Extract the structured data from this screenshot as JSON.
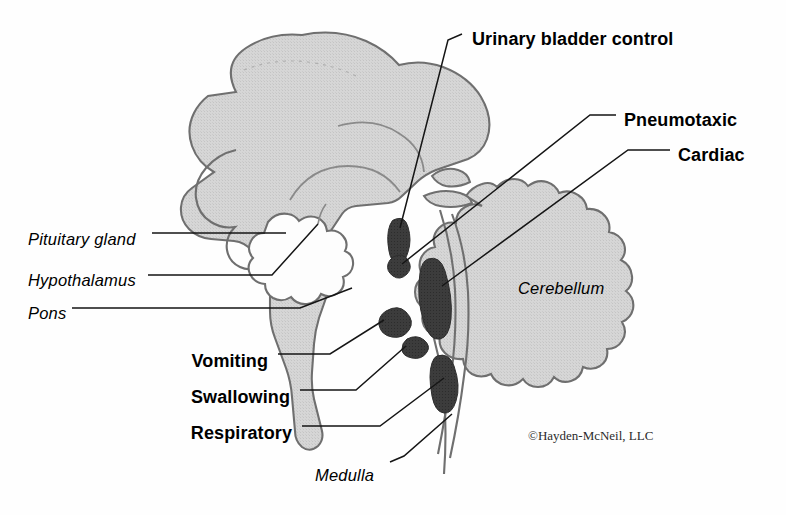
{
  "figure": {
    "copyright": "©Hayden-McNeil, LLC",
    "colors": {
      "background": "#fefefe",
      "tissue_fill": "#d4d4d4",
      "tissue_stroke": "#6f6f6f",
      "nucleus_fill": "#3a3a3a",
      "leader_line": "#1a1a1a",
      "text": "#000000"
    }
  },
  "structure_labels": [
    {
      "id": "pituitary-gland",
      "text": "Pituitary gland",
      "style": "italic",
      "x": 28,
      "y": 230
    },
    {
      "id": "hypothalamus",
      "text": "Hypothalamus",
      "style": "italic",
      "x": 28,
      "y": 271
    },
    {
      "id": "pons",
      "text": "Pons",
      "style": "italic",
      "x": 28,
      "y": 304
    },
    {
      "id": "cerebellum",
      "text": "Cerebellum",
      "style": "italic",
      "x": 518,
      "y": 279
    },
    {
      "id": "medulla",
      "text": "Medulla",
      "style": "italic",
      "x": 315,
      "y": 466
    }
  ],
  "center_labels": [
    {
      "id": "urinary-bladder-control",
      "text": "Urinary bladder control",
      "style": "bold",
      "align": "left",
      "x": 472,
      "y": 29
    },
    {
      "id": "pneumotaxic",
      "text": "Pneumotaxic",
      "style": "bold",
      "align": "left",
      "x": 624,
      "y": 110
    },
    {
      "id": "cardiac",
      "text": "Cardiac",
      "style": "bold",
      "align": "left",
      "x": 678,
      "y": 145
    },
    {
      "id": "vomiting",
      "text": "Vomiting",
      "style": "bold",
      "align": "right",
      "x": 268,
      "y": 351
    },
    {
      "id": "swallowing",
      "text": "Swallowing",
      "style": "bold",
      "align": "right",
      "x": 290,
      "y": 387
    },
    {
      "id": "respiratory",
      "text": "Respiratory",
      "style": "bold",
      "align": "right",
      "x": 292,
      "y": 423
    }
  ],
  "nuclei": [
    {
      "id": "urinary-bladder-nucleus",
      "label": "Urinary bladder control"
    },
    {
      "id": "pneumotaxic-nucleus",
      "label": "Pneumotaxic"
    },
    {
      "id": "cardiac-nucleus",
      "label": "Cardiac"
    },
    {
      "id": "vomiting-nucleus",
      "label": "Vomiting"
    },
    {
      "id": "swallowing-nucleus",
      "label": "Swallowing"
    },
    {
      "id": "respiratory-nucleus",
      "label": "Respiratory"
    }
  ],
  "copyright": {
    "text": "©Hayden-McNeil, LLC",
    "x": 528,
    "y": 428
  }
}
